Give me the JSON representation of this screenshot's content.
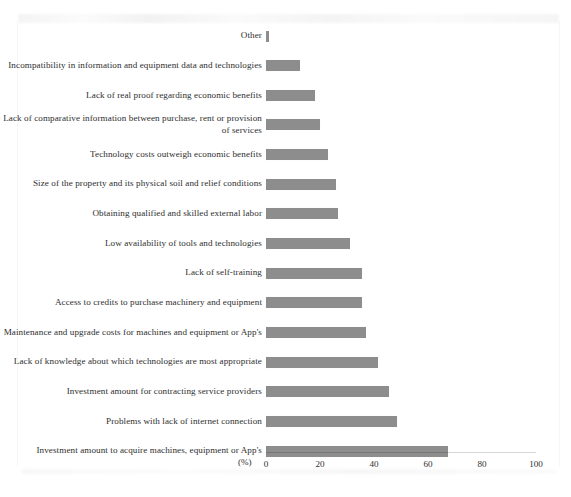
{
  "chart_data": {
    "type": "bar",
    "orientation": "horizontal",
    "title": "",
    "subtitle": "",
    "xlabel": "(%)",
    "ylabel": "",
    "xlim": [
      0,
      100
    ],
    "xticks": [
      0,
      20,
      40,
      60,
      80,
      100
    ],
    "grid": false,
    "legend": null,
    "bar_color": "#8d8d8d",
    "categories": [
      "Other",
      "Incompatibility in information and equipment data and technologies",
      "Lack of real proof regarding economic benefits",
      "Lack of comparative information between purchase, rent or provision of services",
      "Technology costs outweigh economic benefits",
      "Size of the property and its physical soil and relief conditions",
      "Obtaining qualified and skilled external labor",
      "Low availability of tools and technologies",
      "Lack of self-training",
      "Access to credits to purchase machinery and equipment",
      "Maintenance and upgrade costs for machines and equipment or App's",
      "Lack of knowledge about which technologies are most appropriate",
      "Investment amount for contracting service providers",
      "Problems with lack of internet connection",
      "Investment amount to acquire machines, equipment or App's"
    ],
    "values": [
      1,
      12.6,
      18,
      20,
      23,
      26,
      26.5,
      31,
      35.5,
      35.5,
      37,
      41.5,
      45.5,
      48.5,
      67.5
    ]
  },
  "axis": {
    "unit": "(%)",
    "tick_labels": [
      "0",
      "20",
      "40",
      "60",
      "80",
      "100"
    ]
  }
}
